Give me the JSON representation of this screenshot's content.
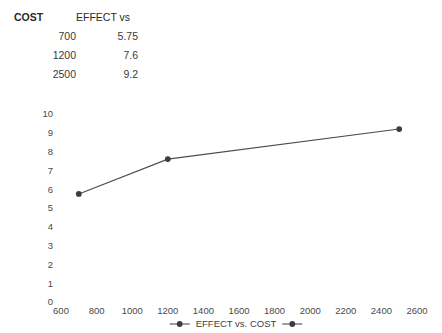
{
  "table": {
    "headers": [
      "COST",
      "EFFECT vs"
    ],
    "rows": [
      {
        "cost": "700",
        "effect": "5.75"
      },
      {
        "cost": "1200",
        "effect": "7.6"
      },
      {
        "cost": "2500",
        "effect": "9.2"
      }
    ]
  },
  "chart_data": {
    "type": "line",
    "title": "",
    "xlabel": "",
    "ylabel": "",
    "x": [
      700,
      1200,
      2500
    ],
    "values": [
      5.75,
      7.6,
      9.2
    ],
    "series": [
      {
        "name": "EFFECT vs. COST",
        "x": [
          700,
          1200,
          2500
        ],
        "values": [
          5.75,
          7.6,
          9.2
        ]
      }
    ],
    "xlim": [
      600,
      2600
    ],
    "ylim": [
      0,
      10
    ],
    "xticks": [
      600,
      800,
      1000,
      1200,
      1400,
      1600,
      1800,
      2000,
      2200,
      2400,
      2600
    ],
    "xtick_labels": [
      "600",
      "800",
      "1000",
      "1200",
      "1400",
      "1600",
      "1800",
      "2000",
      "2200",
      "2400",
      "2600"
    ],
    "yticks": [
      0,
      1,
      2,
      3,
      4,
      5,
      6,
      7,
      8,
      9,
      10
    ],
    "ytick_labels": [
      "0",
      "1",
      "2",
      "3",
      "4",
      "5",
      "6",
      "7",
      "8",
      "9",
      "10"
    ],
    "grid": false,
    "axis_lines": false,
    "legend_position": "bottom",
    "legend": [
      {
        "label": "EFFECT vs. COST",
        "color": "#4b4b56",
        "marker": "circle"
      }
    ],
    "colors": {
      "line": "#4b4b56",
      "marker": "#3c3c46",
      "text": "#4a4a4a",
      "background": "#ffffff"
    }
  }
}
